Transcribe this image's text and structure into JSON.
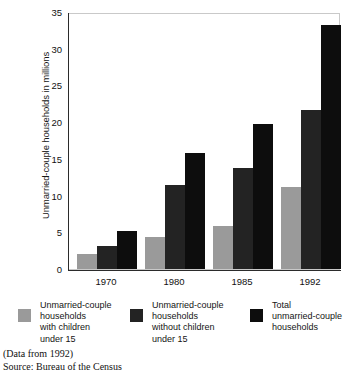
{
  "chart_data": {
    "type": "bar",
    "title": "",
    "xlabel": "",
    "ylabel": "Unmarried-couple households in millions",
    "categories": [
      "1970",
      "1980",
      "1985",
      "1992"
    ],
    "ylim": [
      0,
      35
    ],
    "yticks": [
      0,
      5,
      10,
      15,
      20,
      25,
      30,
      35
    ],
    "grid": false,
    "legend_position": "bottom",
    "series": [
      {
        "name": "Unmarried-couple households with children under 15",
        "name_lines": [
          "Unmarried-couple",
          "households",
          "with children",
          "under 15"
        ],
        "color": "#9a9a9a",
        "values": [
          2.0,
          4.3,
          5.9,
          11.2
        ]
      },
      {
        "name": "Unmarried-couple households without children under 15",
        "name_lines": [
          "Unmarried-couple",
          "households",
          "without children",
          "under 15"
        ],
        "color": "#232323",
        "values": [
          3.2,
          11.5,
          13.7,
          21.7
        ]
      },
      {
        "name": "Total unmarried-couple households",
        "name_lines": [
          "Total",
          "unmarried-couple",
          "households"
        ],
        "color": "#0d0d0d",
        "values": [
          5.2,
          15.8,
          19.8,
          33.2
        ]
      }
    ]
  },
  "footer": {
    "data_note": "(Data from 1992)",
    "source": "Source: Bureau of the Census"
  }
}
